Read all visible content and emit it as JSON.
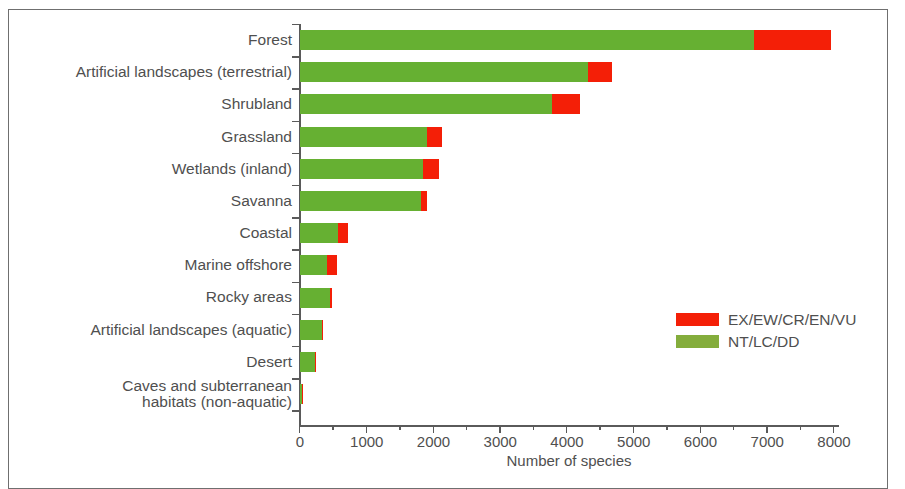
{
  "figure": {
    "x_axis_title": "Number of species",
    "colors": {
      "threatened": "#f41f07",
      "non_threatened": "#66b032",
      "axis": "#5a5a5a",
      "text": "#4f4f4f",
      "frame": "#6f6f6f",
      "background": "#ffffff"
    }
  },
  "legend": {
    "position": "inside-right",
    "entries": [
      {
        "label": "EX/EW/CR/EN/VU",
        "color": "#f41f07",
        "swatch": "red-swatch"
      },
      {
        "label": "NT/LC/DD",
        "color": "#84ad3c",
        "swatch": "green-swatch"
      }
    ]
  },
  "chart_data": {
    "type": "bar",
    "orientation": "horizontal",
    "stacked": true,
    "title": "",
    "subtitle": "",
    "xlabel": "Number of species",
    "ylabel": "",
    "xlim": [
      0,
      8000
    ],
    "xticks": [
      0,
      1000,
      2000,
      3000,
      4000,
      5000,
      6000,
      7000,
      8000
    ],
    "xtick_labels": [
      "0",
      "1000",
      "2000",
      "3000",
      "4000",
      "5000",
      "6000",
      "7000",
      "8000"
    ],
    "minor_xtick_interval": 500,
    "grid": false,
    "categories": [
      "Forest",
      "Artificial landscapes (terrestrial)",
      "Shrubland",
      "Grassland",
      "Wetlands (inland)",
      "Savanna",
      "Coastal",
      "Marine offshore",
      "Rocky areas",
      "Artificial landscapes (aquatic)",
      "Desert",
      "Caves and subterranean\nhabitats (non-aquatic)"
    ],
    "series": [
      {
        "name": "NT/LC/DD",
        "color": "#66b032",
        "values": [
          6800,
          4320,
          3780,
          1900,
          1840,
          1810,
          570,
          405,
          450,
          330,
          225,
          35
        ]
      },
      {
        "name": "EX/EW/CR/EN/VU",
        "color": "#f41f07",
        "values": [
          1150,
          360,
          420,
          230,
          240,
          100,
          150,
          150,
          30,
          20,
          15,
          5
        ]
      }
    ],
    "totals": [
      7950,
      4680,
      4200,
      2130,
      2080,
      1910,
      720,
      555,
      480,
      350,
      240,
      40
    ]
  }
}
